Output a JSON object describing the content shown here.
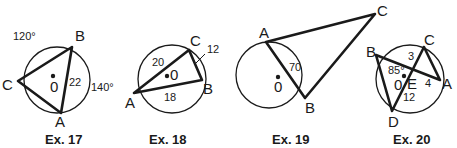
{
  "figures": [
    {
      "caption": "Ex. 17",
      "points": {
        "A": "A",
        "B": "B",
        "C": "C",
        "O": "0"
      },
      "labels": {
        "arc_cb": "120°",
        "arc_ba": "140°",
        "chord_ab": "22"
      }
    },
    {
      "caption": "Ex. 18",
      "points": {
        "A": "A",
        "B": "B",
        "C": "C",
        "O": "0"
      },
      "labels": {
        "chord_ac": "20",
        "chord_cb": "12",
        "chord_ab": "18"
      }
    },
    {
      "caption": "Ex. 19",
      "points": {
        "A": "A",
        "B": "B",
        "C": "C",
        "O": "0"
      },
      "labels": {
        "chord_ab": "70"
      }
    },
    {
      "caption": "Ex. 20",
      "points": {
        "A": "A",
        "B": "B",
        "C": "C",
        "D": "D",
        "E": "E",
        "O": "0"
      },
      "labels": {
        "angle_bed": "85°",
        "seg_ce": "3",
        "seg_ea": "4",
        "seg_ed": "12"
      }
    }
  ]
}
